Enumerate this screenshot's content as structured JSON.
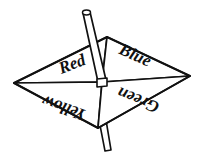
{
  "figure": {
    "name": "four-color-spinner",
    "background_color": "#ffffff",
    "line_color": "#111111",
    "fill_color": "#ffffff",
    "shading_color": "#e8e8e8"
  },
  "spinner": {
    "body_shape": "rhombus",
    "vertices": {
      "left": {
        "x": 14,
        "y": 83
      },
      "top": {
        "x": 107,
        "y": 37
      },
      "right": {
        "x": 190,
        "y": 76
      },
      "bottom": {
        "x": 98,
        "y": 128
      }
    },
    "center": {
      "x": 102,
      "y": 82
    },
    "sectors": [
      {
        "id": "red",
        "label": "Red",
        "position": "upper-left",
        "text_x": 74,
        "text_y": 69,
        "rotation": -21,
        "font_size": 17
      },
      {
        "id": "blue",
        "label": "Blue",
        "position": "upper-right",
        "text_x": 119,
        "text_y": 56,
        "rotation": 24,
        "font_size": 17
      },
      {
        "id": "yellow",
        "label": "Yellow",
        "position": "lower-left",
        "text_x": 90,
        "text_y": 98,
        "rotation": 200,
        "font_size": 17
      },
      {
        "id": "green",
        "label": "Green",
        "position": "lower-right",
        "text_x": 147,
        "text_y": 96,
        "rotation": 202,
        "font_size": 17
      }
    ]
  },
  "spindle": {
    "name": "spindle-stick",
    "top_tip": {
      "x": 86,
      "y": 11
    },
    "bottom_tip": {
      "x": 110,
      "y": 150
    },
    "width": 8
  }
}
